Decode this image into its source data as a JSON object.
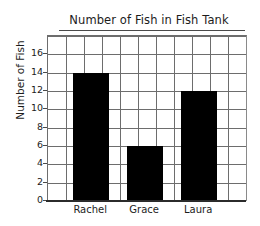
{
  "chart_data": {
    "type": "bar",
    "title": "Number of Fish in Fish Tank",
    "xlabel": "",
    "ylabel": "Number of Fish",
    "categories": [
      "Rachel",
      "Grace",
      "Laura"
    ],
    "values": [
      14,
      6,
      12
    ],
    "ylim": [
      0,
      18
    ],
    "y_ticks": [
      0,
      2,
      4,
      6,
      8,
      10,
      12,
      14,
      16
    ],
    "y_tick_labels": [
      "0",
      "2",
      "4",
      "6",
      "8",
      "10",
      "12",
      "14",
      "16"
    ],
    "y_tick_interval": 2,
    "grid": true,
    "grid_vertical_columns": 11,
    "legend": null,
    "legend_position": "none",
    "bar_color": "#000000",
    "grid_color": "#6d6d6d",
    "axis_color": "#2b2b2b",
    "background_color": "#ffffff",
    "series": [
      {
        "name": "Number of Fish",
        "values": [
          14,
          6,
          12
        ]
      }
    ],
    "points": [
      {
        "category": "Rachel",
        "value": 14
      },
      {
        "category": "Grace",
        "value": 6
      },
      {
        "category": "Laura",
        "value": 12
      }
    ]
  }
}
